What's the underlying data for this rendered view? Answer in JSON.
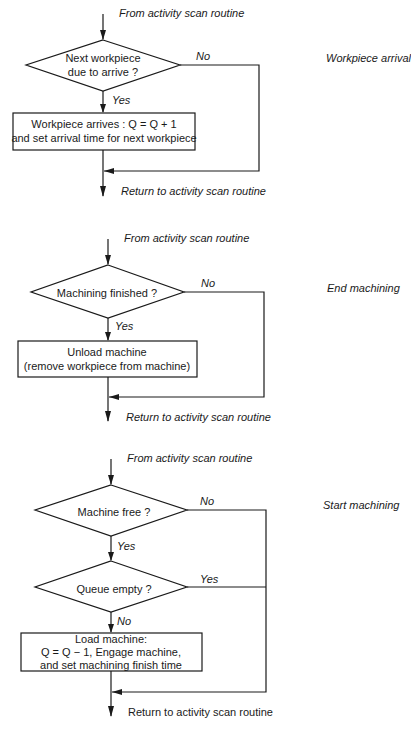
{
  "diagram": {
    "type": "flowchart",
    "stroke_color": "#1a1a1a",
    "background": "#ffffff",
    "sections": [
      {
        "side_label": "Workpiece arrival",
        "entry_label": "From activity scan routine",
        "decision": {
          "line1": "Next workpiece",
          "line2": "due to arrive ?",
          "yes_label": "Yes",
          "no_label": "No"
        },
        "process": {
          "line1": "Workpiece arrives : Q = Q + 1",
          "line2": "and set arrival time for next workpiece"
        },
        "exit_label": "Return to activity scan routine"
      },
      {
        "side_label": "End machining",
        "entry_label": "From activity scan routine",
        "decision": {
          "line1": "Machining finished ?",
          "yes_label": "Yes",
          "no_label": "No"
        },
        "process": {
          "line1": "Unload machine",
          "line2": "(remove workpiece from machine)"
        },
        "exit_label": "Return to activity scan routine"
      },
      {
        "side_label": "Start machining",
        "entry_label": "From activity scan routine",
        "decision1": {
          "line1": "Machine free ?",
          "yes_label": "Yes",
          "no_label": "No"
        },
        "decision2": {
          "line1": "Queue empty ?",
          "yes_label": "Yes",
          "no_label": "No"
        },
        "process": {
          "line1": "Load machine:",
          "line2": "Q = Q − 1, Engage machine,",
          "line3": "and set machining finish time"
        },
        "exit_label": "Return to activity scan routine"
      }
    ]
  }
}
